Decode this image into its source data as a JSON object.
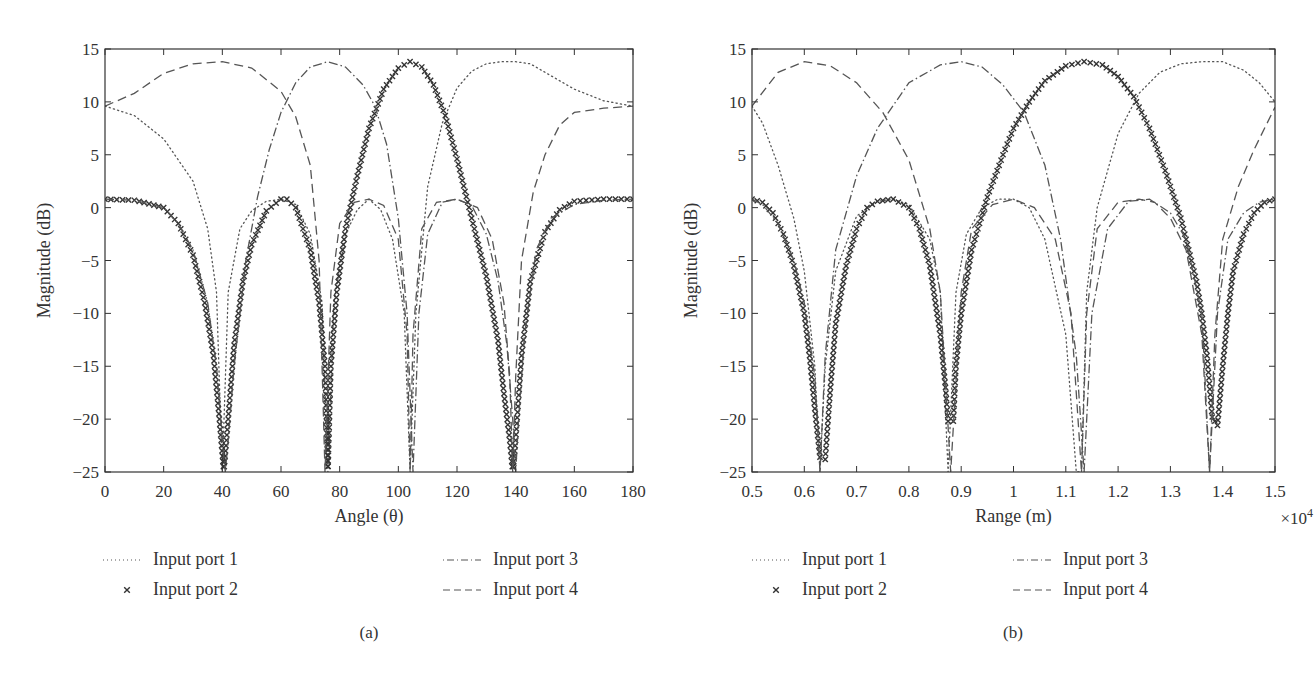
{
  "chart_data": [
    {
      "id": "a",
      "type": "line",
      "caption": "(a)",
      "xlabel": "Angle (θ)",
      "ylabel": "Magnitude (dB)",
      "xlim": [
        0,
        180
      ],
      "ylim": [
        -25,
        15
      ],
      "xticks": [
        0,
        20,
        40,
        60,
        80,
        100,
        120,
        140,
        160,
        180
      ],
      "xtick_labels": [
        "0",
        "20",
        "40",
        "60",
        "80",
        "100",
        "120",
        "140",
        "160",
        "180"
      ],
      "yticks": [
        15,
        10,
        5,
        0,
        -5,
        -10,
        -15,
        -20,
        -25
      ],
      "ytick_labels": [
        "15",
        "10",
        "5",
        "0",
        "−5",
        "−10",
        "−15",
        "−20",
        "−25"
      ],
      "x_multiplier": "",
      "grid": false,
      "legend_position": "below",
      "series": [
        {
          "name": "Input port 1",
          "style": "dotted",
          "peak_main": {
            "x": 140,
            "y": 13.8
          },
          "nulls": [
            40,
            76,
            104
          ],
          "sidelobes": [
            {
              "x": 90,
              "y": 0.8
            },
            {
              "x": 60,
              "y": 0.8
            }
          ],
          "x": [
            0,
            10,
            20,
            30,
            35,
            38,
            40,
            42,
            46,
            50,
            55,
            60,
            65,
            70,
            74,
            76,
            78,
            82,
            86,
            90,
            94,
            98,
            102,
            104,
            106,
            110,
            115,
            120,
            125,
            130,
            135,
            140,
            145,
            150,
            160,
            170,
            180
          ],
          "y": [
            9.6,
            8.7,
            6.5,
            2.5,
            -2,
            -8,
            -25,
            -8,
            -2,
            -0.3,
            0.6,
            0.8,
            0.3,
            -2.5,
            -9,
            -25,
            -9,
            -2.5,
            -0.2,
            0.8,
            -0.2,
            -3,
            -10,
            -25,
            -10,
            2,
            8,
            11.3,
            12.9,
            13.6,
            13.8,
            13.8,
            13.6,
            12.8,
            11.2,
            10.1,
            9.6
          ]
        },
        {
          "name": "Input port 2",
          "style": "x-markers",
          "peak_main": {
            "x": 104,
            "y": 13.8
          },
          "nulls": [
            41,
            76,
            139
          ],
          "x": [
            0,
            10,
            20,
            25,
            30,
            34,
            37,
            39,
            40.5,
            42,
            44,
            47,
            50,
            55,
            60,
            62,
            65,
            70,
            73,
            75,
            76,
            77,
            79,
            82,
            86,
            90,
            95,
            100,
            104,
            108,
            112,
            116,
            120,
            125,
            130,
            134,
            136,
            138,
            139,
            140,
            142,
            145,
            150,
            155,
            160,
            170,
            180
          ],
          "y": [
            0.8,
            0.7,
            0,
            -1.5,
            -4.5,
            -9,
            -14,
            -20,
            -25,
            -20,
            -13,
            -7,
            -3.5,
            -0.3,
            0.8,
            0.8,
            0,
            -4,
            -9,
            -15,
            -25,
            -15,
            -8,
            -2,
            3,
            7.5,
            11.2,
            13.2,
            13.8,
            13.3,
            11.6,
            8.7,
            4.6,
            -1,
            -6.5,
            -12.6,
            -17.6,
            -22,
            -25,
            -22,
            -14,
            -7,
            -2.3,
            -0.2,
            0.6,
            0.8,
            0.8
          ]
        },
        {
          "name": "Input port 3",
          "style": "dash-dot",
          "peak_main": {
            "x": 76,
            "y": 13.8
          },
          "nulls": [
            41,
            105,
            140
          ],
          "x": [
            0,
            10,
            20,
            25,
            30,
            35,
            38,
            40,
            41,
            42,
            44,
            48,
            52,
            56,
            60,
            65,
            70,
            76,
            82,
            88,
            92,
            96,
            100,
            103,
            105,
            107,
            110,
            115,
            120,
            125,
            130,
            134,
            137,
            139,
            140,
            141,
            143,
            147,
            152,
            160,
            170,
            180
          ],
          "y": [
            0.8,
            0.7,
            0,
            -1.5,
            -4,
            -9,
            -15,
            -22,
            -25,
            -22,
            -15,
            -5,
            1,
            5.5,
            9,
            11.8,
            13.3,
            13.8,
            13.3,
            11.6,
            9.6,
            6,
            -1,
            -10,
            -25,
            -10,
            -2.5,
            0.5,
            0.8,
            0.2,
            -2.5,
            -7,
            -13,
            -20,
            -25,
            -20,
            -12,
            -4,
            -1,
            0.3,
            0.7,
            0.8
          ]
        },
        {
          "name": "Input port 4",
          "style": "dashed",
          "peak_main": {
            "x": 40,
            "y": 13.8
          },
          "nulls": [
            75,
            104,
            139
          ],
          "x": [
            0,
            10,
            20,
            30,
            40,
            50,
            60,
            65,
            70,
            73,
            75,
            77,
            80,
            85,
            90,
            95,
            100,
            103,
            104,
            105,
            108,
            113,
            120,
            127,
            132,
            136,
            138,
            139,
            140,
            142,
            146,
            150,
            155,
            160,
            170,
            180
          ],
          "y": [
            9.6,
            10.8,
            12.7,
            13.6,
            13.8,
            13.2,
            11,
            8.6,
            4,
            -5,
            -25,
            -8,
            -1.5,
            0.5,
            0.8,
            0.2,
            -3,
            -12,
            -25,
            -12,
            -2,
            0.5,
            0.8,
            0,
            -3,
            -9,
            -16,
            -25,
            -16,
            -5,
            1.5,
            5,
            7.8,
            9,
            9.4,
            9.6
          ]
        }
      ]
    },
    {
      "id": "b",
      "type": "line",
      "caption": "(b)",
      "xlabel": "Range (m)",
      "ylabel": "Magnitude (dB)",
      "xlim": [
        0.5,
        1.5
      ],
      "ylim": [
        -25,
        15
      ],
      "xticks": [
        0.5,
        0.6,
        0.7,
        0.8,
        0.9,
        1.0,
        1.1,
        1.2,
        1.3,
        1.4,
        1.5
      ],
      "xtick_labels": [
        "0.5",
        "0.6",
        "0.7",
        "0.8",
        "0.9",
        "1",
        "1.1",
        "1.2",
        "1.3",
        "1.4",
        "1.5"
      ],
      "yticks": [
        15,
        10,
        5,
        0,
        -5,
        -10,
        -15,
        -20,
        -25
      ],
      "ytick_labels": [
        "15",
        "10",
        "5",
        "0",
        "−5",
        "−10",
        "−15",
        "−20",
        "−25"
      ],
      "x_multiplier": "×10",
      "x_multiplier_exp": "4",
      "grid": false,
      "legend_position": "below",
      "series": [
        {
          "name": "Input port 1",
          "style": "dotted",
          "x": [
            0.5,
            0.52,
            0.55,
            0.58,
            0.6,
            0.62,
            0.63,
            0.64,
            0.66,
            0.7,
            0.74,
            0.77,
            0.8,
            0.84,
            0.86,
            0.875,
            0.89,
            0.91,
            0.94,
            0.97,
            1.0,
            1.03,
            1.06,
            1.1,
            1.12,
            1.13,
            1.14,
            1.16,
            1.2,
            1.24,
            1.28,
            1.32,
            1.36,
            1.4,
            1.44,
            1.47,
            1.5
          ],
          "y": [
            9.6,
            8,
            4,
            -1,
            -6,
            -15,
            -25,
            -15,
            -6,
            -0.8,
            0.6,
            0.8,
            0.3,
            -3,
            -8,
            -25,
            -8,
            -2.5,
            0,
            0.8,
            0.8,
            0,
            -3,
            -12,
            -25,
            -25,
            -8,
            0,
            7,
            10.8,
            12.8,
            13.6,
            13.8,
            13.8,
            13,
            11.8,
            10
          ]
        },
        {
          "name": "Input port 2",
          "style": "x-markers",
          "x": [
            0.5,
            0.52,
            0.54,
            0.56,
            0.58,
            0.6,
            0.61,
            0.62,
            0.63,
            0.64,
            0.65,
            0.66,
            0.68,
            0.7,
            0.72,
            0.74,
            0.77,
            0.8,
            0.82,
            0.84,
            0.86,
            0.87,
            0.875,
            0.885,
            0.89,
            0.9,
            0.92,
            0.95,
            0.98,
            1.0,
            1.03,
            1.06,
            1.1,
            1.135,
            1.17,
            1.2,
            1.23,
            1.26,
            1.29,
            1.32,
            1.35,
            1.36,
            1.37,
            1.38,
            1.39,
            1.4,
            1.41,
            1.42,
            1.44,
            1.46,
            1.48,
            1.5
          ],
          "y": [
            0.8,
            0.5,
            -0.5,
            -2.5,
            -5.5,
            -10,
            -14,
            -19,
            -23.6,
            -23.8,
            -17,
            -11,
            -5.5,
            -2,
            0,
            0.6,
            0.8,
            0,
            -2,
            -5.5,
            -12,
            -17,
            -20.2,
            -20.2,
            -15,
            -10,
            -4,
            1,
            5,
            7.5,
            10,
            12,
            13.4,
            13.8,
            13.5,
            12.4,
            10.5,
            7.5,
            3.5,
            -1,
            -7,
            -10,
            -14,
            -19.8,
            -20.6,
            -15,
            -10,
            -6,
            -2.5,
            -0.5,
            0.5,
            0.8
          ]
        },
        {
          "name": "Input port 3",
          "style": "dash-dot",
          "x": [
            0.5,
            0.52,
            0.55,
            0.58,
            0.6,
            0.62,
            0.63,
            0.64,
            0.66,
            0.7,
            0.74,
            0.8,
            0.86,
            0.9,
            0.94,
            0.98,
            1.02,
            1.06,
            1.09,
            1.12,
            1.135,
            1.15,
            1.18,
            1.22,
            1.26,
            1.3,
            1.33,
            1.36,
            1.375,
            1.39,
            1.41,
            1.44,
            1.47,
            1.5
          ],
          "y": [
            0.8,
            0.3,
            -1.5,
            -5,
            -9,
            -16,
            -25,
            -14,
            -4,
            3,
            7.5,
            11.8,
            13.5,
            13.8,
            13.3,
            11.6,
            9,
            4,
            -3,
            -14,
            -25,
            -10,
            -2,
            0.6,
            0.8,
            -0.5,
            -3,
            -10,
            -25,
            -10,
            -3,
            -0.5,
            0.5,
            0.8
          ]
        },
        {
          "name": "Input port 4",
          "style": "dashed",
          "x": [
            0.5,
            0.55,
            0.6,
            0.65,
            0.7,
            0.75,
            0.8,
            0.84,
            0.86,
            0.88,
            0.9,
            0.92,
            0.96,
            1.0,
            1.04,
            1.08,
            1.11,
            1.13,
            1.14,
            1.16,
            1.2,
            1.24,
            1.27,
            1.3,
            1.33,
            1.36,
            1.375,
            1.385,
            1.4,
            1.43,
            1.46,
            1.5
          ],
          "y": [
            9.6,
            12.8,
            13.8,
            13.4,
            11.8,
            9,
            4.5,
            -2,
            -8,
            -25,
            -8,
            -2,
            0.3,
            0.8,
            0,
            -3,
            -10,
            -25,
            -10,
            -2,
            0.5,
            0.8,
            0.5,
            -1,
            -4,
            -12,
            -25,
            -12,
            -3,
            2,
            5.5,
            9.5
          ]
        }
      ]
    }
  ],
  "figure": {
    "a": {
      "caption": "(a)",
      "xlabel": "Angle (θ)",
      "ylabel": "Magnitude (dB)"
    },
    "b": {
      "caption": "(b)",
      "xlabel": "Range (m)",
      "ylabel": "Magnitude (dB)",
      "multiplier": "×10",
      "multiplier_exp": "4"
    },
    "legend": [
      {
        "label": "Input port 1",
        "style": "dotted"
      },
      {
        "label": "Input port 2",
        "style": "x-markers"
      },
      {
        "label": "Input port 3",
        "style": "dash-dot"
      },
      {
        "label": "Input port 4",
        "style": "dashed"
      }
    ]
  },
  "colors": {
    "line": "#555555",
    "marker": "#333333",
    "axis": "#333333"
  }
}
